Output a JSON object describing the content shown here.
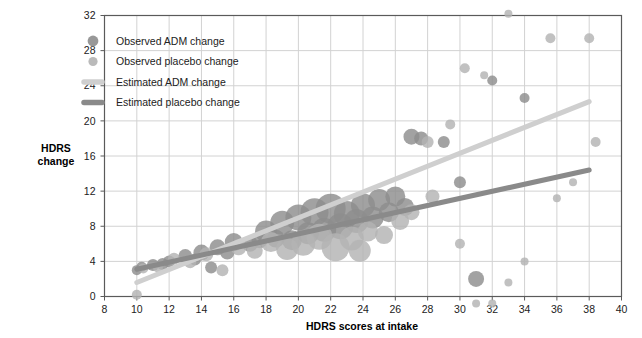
{
  "chart_data": {
    "type": "scatter",
    "title": "",
    "xlabel": "HDRS scores at intake",
    "ylabel": "HDRS change",
    "xlim": [
      8,
      40
    ],
    "ylim": [
      0,
      32
    ],
    "xticks": [
      8,
      10,
      12,
      14,
      16,
      18,
      20,
      22,
      24,
      26,
      28,
      30,
      32,
      34,
      36,
      38,
      40
    ],
    "yticks": [
      0,
      4,
      8,
      12,
      16,
      20,
      24,
      28,
      32
    ],
    "grid": true,
    "legend_position": "top-left",
    "colors": {
      "adm_marker": "#8d8d8d",
      "placebo_marker": "#b3b3b3",
      "adm_line": "#cfcfcf",
      "placebo_line": "#8a8a8a",
      "grid": "#d2d2d2",
      "axis": "#5a5a5a",
      "text": "#222222"
    },
    "legend": [
      {
        "label": "Observed ADM change",
        "kind": "marker",
        "color": "#8d8d8d"
      },
      {
        "label": "Observed placebo change",
        "kind": "marker",
        "color": "#b3b3b3"
      },
      {
        "label": "Estimated ADM change",
        "kind": "line",
        "color": "#cfcfcf"
      },
      {
        "label": "Estimated placebo change",
        "kind": "line",
        "color": "#8a8a8a"
      }
    ],
    "series": [
      {
        "name": "Observed ADM change",
        "marker_color": "#8d8d8d",
        "points": [
          {
            "x": 10.0,
            "y": 3.0,
            "size": 5
          },
          {
            "x": 10.3,
            "y": 3.4,
            "size": 5
          },
          {
            "x": 11.0,
            "y": 3.6,
            "size": 6
          },
          {
            "x": 11.6,
            "y": 3.7,
            "size": 6
          },
          {
            "x": 12.0,
            "y": 4.0,
            "size": 6
          },
          {
            "x": 13.0,
            "y": 4.6,
            "size": 7
          },
          {
            "x": 13.6,
            "y": 4.2,
            "size": 6
          },
          {
            "x": 14.0,
            "y": 5.0,
            "size": 8
          },
          {
            "x": 14.6,
            "y": 3.3,
            "size": 6
          },
          {
            "x": 15.0,
            "y": 5.6,
            "size": 8
          },
          {
            "x": 15.6,
            "y": 5.0,
            "size": 7
          },
          {
            "x": 16.0,
            "y": 6.2,
            "size": 9
          },
          {
            "x": 17.0,
            "y": 6.0,
            "size": 8
          },
          {
            "x": 17.6,
            "y": 6.4,
            "size": 8
          },
          {
            "x": 18.0,
            "y": 7.4,
            "size": 11
          },
          {
            "x": 18.6,
            "y": 6.6,
            "size": 9
          },
          {
            "x": 19.0,
            "y": 8.4,
            "size": 12
          },
          {
            "x": 19.6,
            "y": 6.4,
            "size": 10
          },
          {
            "x": 20.0,
            "y": 9.0,
            "size": 13
          },
          {
            "x": 20.6,
            "y": 7.2,
            "size": 11
          },
          {
            "x": 21.0,
            "y": 9.6,
            "size": 14
          },
          {
            "x": 21.6,
            "y": 7.6,
            "size": 12
          },
          {
            "x": 22.0,
            "y": 10.0,
            "size": 15
          },
          {
            "x": 22.6,
            "y": 8.0,
            "size": 13
          },
          {
            "x": 23.0,
            "y": 9.4,
            "size": 13
          },
          {
            "x": 23.6,
            "y": 8.6,
            "size": 12
          },
          {
            "x": 24.0,
            "y": 10.4,
            "size": 12
          },
          {
            "x": 24.6,
            "y": 9.0,
            "size": 11
          },
          {
            "x": 25.0,
            "y": 11.0,
            "size": 11
          },
          {
            "x": 25.6,
            "y": 9.6,
            "size": 10
          },
          {
            "x": 26.0,
            "y": 11.4,
            "size": 10
          },
          {
            "x": 26.6,
            "y": 10.2,
            "size": 9
          },
          {
            "x": 27.0,
            "y": 18.2,
            "size": 8
          },
          {
            "x": 27.6,
            "y": 18.0,
            "size": 7
          },
          {
            "x": 29.0,
            "y": 17.6,
            "size": 6
          },
          {
            "x": 30.0,
            "y": 13.0,
            "size": 6
          },
          {
            "x": 31.0,
            "y": 2.0,
            "size": 8
          },
          {
            "x": 32.0,
            "y": 24.6,
            "size": 5
          },
          {
            "x": 34.0,
            "y": 22.6,
            "size": 5
          }
        ]
      },
      {
        "name": "Observed placebo change",
        "marker_color": "#b3b3b3",
        "points": [
          {
            "x": 10.0,
            "y": 0.2,
            "size": 5
          },
          {
            "x": 10.4,
            "y": 3.2,
            "size": 5
          },
          {
            "x": 11.3,
            "y": 3.3,
            "size": 5
          },
          {
            "x": 12.3,
            "y": 4.3,
            "size": 6
          },
          {
            "x": 13.3,
            "y": 3.9,
            "size": 6
          },
          {
            "x": 14.3,
            "y": 4.8,
            "size": 7
          },
          {
            "x": 15.3,
            "y": 3.0,
            "size": 6
          },
          {
            "x": 16.3,
            "y": 5.6,
            "size": 8
          },
          {
            "x": 17.3,
            "y": 5.2,
            "size": 8
          },
          {
            "x": 18.3,
            "y": 6.2,
            "size": 10
          },
          {
            "x": 19.3,
            "y": 5.4,
            "size": 11
          },
          {
            "x": 20.3,
            "y": 6.0,
            "size": 12
          },
          {
            "x": 21.3,
            "y": 6.8,
            "size": 13
          },
          {
            "x": 22.3,
            "y": 5.6,
            "size": 14
          },
          {
            "x": 23.3,
            "y": 6.6,
            "size": 12
          },
          {
            "x": 23.8,
            "y": 5.2,
            "size": 11
          },
          {
            "x": 24.3,
            "y": 7.4,
            "size": 10
          },
          {
            "x": 25.3,
            "y": 7.0,
            "size": 9
          },
          {
            "x": 26.3,
            "y": 8.6,
            "size": 9
          },
          {
            "x": 27.0,
            "y": 9.6,
            "size": 8
          },
          {
            "x": 28.0,
            "y": 17.6,
            "size": 6
          },
          {
            "x": 28.3,
            "y": 11.4,
            "size": 7
          },
          {
            "x": 29.4,
            "y": 19.6,
            "size": 5
          },
          {
            "x": 30.0,
            "y": 6.0,
            "size": 5
          },
          {
            "x": 30.3,
            "y": 26.0,
            "size": 5
          },
          {
            "x": 31.0,
            "y": -0.8,
            "size": 4
          },
          {
            "x": 31.5,
            "y": 25.2,
            "size": 4
          },
          {
            "x": 32.0,
            "y": -0.8,
            "size": 4
          },
          {
            "x": 33.0,
            "y": 32.2,
            "size": 4
          },
          {
            "x": 33.0,
            "y": 1.6,
            "size": 4
          },
          {
            "x": 34.0,
            "y": 4.0,
            "size": 4
          },
          {
            "x": 35.6,
            "y": 29.4,
            "size": 5
          },
          {
            "x": 36.0,
            "y": 11.2,
            "size": 4
          },
          {
            "x": 37.0,
            "y": 13.0,
            "size": 4
          },
          {
            "x": 38.0,
            "y": 29.4,
            "size": 5
          },
          {
            "x": 38.4,
            "y": 17.6,
            "size": 5
          }
        ]
      }
    ],
    "trendlines": [
      {
        "name": "Estimated ADM change",
        "color": "#cfcfcf",
        "width": 5,
        "x1": 10.0,
        "y1": 1.6,
        "x2": 38.0,
        "y2": 22.2
      },
      {
        "name": "Estimated placebo change",
        "color": "#8a8a8a",
        "width": 5,
        "x1": 10.0,
        "y1": 3.1,
        "x2": 38.0,
        "y2": 14.4
      }
    ]
  }
}
